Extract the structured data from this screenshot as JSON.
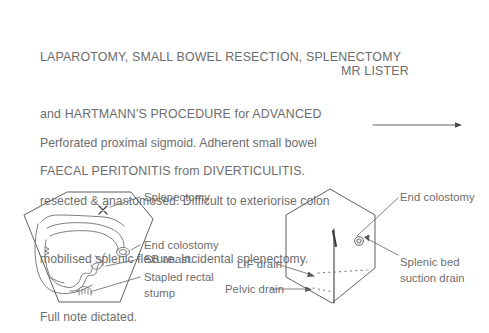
{
  "document": {
    "title_lines": [
      "LAPAROTOMY, SMALL BOWEL RESECTION, SPLENECTOMY",
      "and HARTMANN'S PROCEDURE for ADVANCED",
      "FAECAL PERITONITIS from DIVERTICULITIS."
    ],
    "surgeon": "MR LISTER",
    "narrative_lines": [
      "Perforated proximal sigmoid. Adherent small bowel",
      "resected & anastomosed. Difficult to exteriorise colon",
      "mobilised splenic flexure. Incidental splenectomy.",
      "Full note dictated."
    ]
  },
  "figures": {
    "left_diagram": {
      "name": "abdomen-internal-view",
      "labels": [
        {
          "id": "splenectomy",
          "text": "Splenectomy"
        },
        {
          "id": "end-colostomy",
          "text": "End colostomy"
        },
        {
          "id": "sb-anast",
          "text": "SB anast."
        },
        {
          "id": "stapled-rectal-stump",
          "text": "Stapled rectal\nstump"
        }
      ],
      "markers": [
        {
          "id": "splenectomy-x-mark",
          "symbol": "X"
        }
      ]
    },
    "right_diagram": {
      "name": "abdomen-external-view",
      "labels": [
        {
          "id": "end-colostomy",
          "text": "End colostomy"
        },
        {
          "id": "splenic-bed-suction-drain",
          "text": "Splenic bed\nsuction drain"
        },
        {
          "id": "lif-drain",
          "text": "LIF drain"
        },
        {
          "id": "pelvic-drain",
          "text": "Pelvic drain"
        }
      ],
      "markers": [
        {
          "id": "stoma-circle",
          "symbol": "◎"
        },
        {
          "id": "midline-incision",
          "symbol": "|"
        }
      ]
    }
  },
  "colors": {
    "background": "#ffffff",
    "text": "#6d6d6d",
    "outline": "#5f5f5f",
    "incision": "#3b3b3b"
  }
}
